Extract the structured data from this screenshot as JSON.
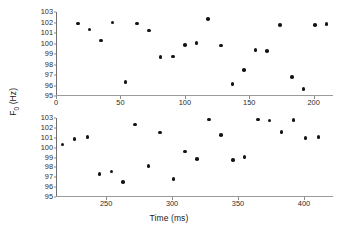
{
  "chart_data": [
    {
      "type": "scatter",
      "panel": "top",
      "title": "",
      "xlabel": "",
      "ylabel": "F0 (Hz)",
      "xlim": [
        0,
        215
      ],
      "ylim": [
        95,
        103
      ],
      "grid": false,
      "legend": null,
      "xticks": [
        0,
        50,
        100,
        150,
        200
      ],
      "yticks": [
        95,
        96,
        97,
        98,
        99,
        100,
        101,
        102,
        103
      ],
      "marker": "filled-circle",
      "marker_color": "#141414",
      "x": [
        17,
        26,
        35,
        44,
        54,
        63,
        72,
        81,
        91,
        100,
        109,
        118,
        128,
        137,
        146,
        155,
        164,
        174,
        183,
        192,
        201,
        210
      ],
      "y": [
        101.9,
        101.35,
        100.3,
        102.0,
        96.35,
        101.9,
        101.25,
        98.7,
        98.75,
        99.85,
        100.05,
        102.35,
        99.8,
        96.15,
        97.5,
        99.4,
        99.3,
        101.75,
        96.8,
        95.65,
        101.75,
        101.85
      ]
    },
    {
      "type": "scatter",
      "panel": "bottom",
      "title": "",
      "xlabel": "Time (ms)",
      "ylabel": "F0 (Hz)",
      "xlim": [
        212,
        422
      ],
      "ylim": [
        95,
        103
      ],
      "grid": false,
      "legend": null,
      "xticks": [
        250,
        300,
        350,
        400
      ],
      "yticks": [
        95,
        96,
        97,
        98,
        99,
        100,
        101,
        102,
        103
      ],
      "marker": "filled-circle",
      "marker_color": "#141414",
      "x": [
        217,
        226,
        236,
        245,
        254,
        263,
        272,
        282,
        291,
        301,
        310,
        319,
        328,
        337,
        346,
        355,
        365,
        374,
        383,
        392,
        401,
        411
      ],
      "y": [
        100.3,
        100.85,
        101.1,
        97.35,
        97.6,
        96.5,
        102.35,
        98.15,
        101.55,
        96.85,
        99.6,
        98.85,
        102.85,
        101.25,
        98.75,
        99.05,
        102.85,
        102.75,
        101.6,
        102.8,
        100.95,
        101.1
      ]
    }
  ],
  "axes": {
    "ylabel_main": "F",
    "ylabel_sub": "0",
    "ylabel_unit": " (Hz)",
    "xlabel": "Time (ms)"
  }
}
